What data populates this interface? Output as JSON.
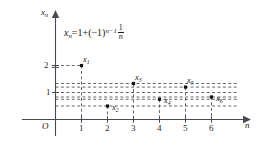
{
  "chart_data": {
    "type": "scatter",
    "title": "",
    "formula": {
      "lhs_var": "x",
      "lhs_sub": "n",
      "eq": "=1+(",
      "minus_one": "−1)",
      "exponent": "n−1",
      "frac_num": "1",
      "frac_den": "n",
      "plain": "x_n = 1 + (-1)^{n-1} · 1/n"
    },
    "xlabel": "n",
    "ylabel": "x",
    "ylabel_sub": "n",
    "origin_label": "O",
    "xlim": [
      0,
      7.15
    ],
    "ylim": [
      0,
      2.55
    ],
    "xticks": [
      1,
      2,
      3,
      4,
      5,
      6
    ],
    "xticklabels": [
      "1",
      "2",
      "3",
      "4",
      "5",
      "6"
    ],
    "yticks": [
      1,
      2
    ],
    "yticklabels": [
      "1",
      "2"
    ],
    "grid": "dashed-horizontal-at-each-point-plus-droplines",
    "legend": "none",
    "points": [
      {
        "label": "x",
        "sub": "1",
        "n": 1,
        "value": 2,
        "value_text": "2",
        "label_pos": "above-right"
      },
      {
        "label": "x",
        "sub": "2",
        "n": 2,
        "value": 0.5,
        "value_text": "1/2",
        "label_pos": "right"
      },
      {
        "label": "x",
        "sub": "3",
        "n": 3,
        "value": 1.3333,
        "value_text": "4/3",
        "label_pos": "above"
      },
      {
        "label": "x",
        "sub": "4",
        "n": 4,
        "value": 0.75,
        "value_text": "3/4",
        "label_pos": "right"
      },
      {
        "label": "x",
        "sub": "5",
        "n": 5,
        "value": 1.2,
        "value_text": "6/5",
        "label_pos": "above"
      },
      {
        "label": "x",
        "sub": "6",
        "n": 6,
        "value": 0.8333,
        "value_text": "5/6",
        "label_pos": "right"
      }
    ],
    "colors": {
      "axis": "#4a4a55",
      "point": "#111111",
      "dash": "#555560",
      "text": "#1a1a1a"
    }
  }
}
